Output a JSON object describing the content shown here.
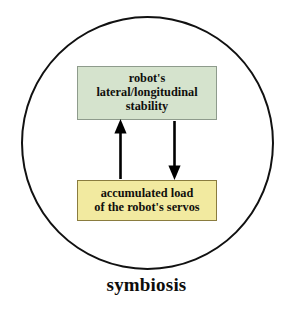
{
  "figure": {
    "caption": "symbiosis",
    "container_shape": "circle",
    "colors": {
      "circle_stroke": "#111111",
      "background": "#ffffff",
      "stability_fill": "#d5e3cd",
      "stability_border": "#8e9b8c",
      "load_fill": "#f2eaa0",
      "load_border": "#8a7c3f",
      "arrow": "#000000",
      "text": "#100f0c"
    },
    "nodes": [
      {
        "id": "stability",
        "lines": [
          "robot's",
          "lateral/longitudinal",
          "stability"
        ]
      },
      {
        "id": "load",
        "lines": [
          "accumulated load",
          "of the robot's servos"
        ]
      }
    ],
    "arrows": [
      {
        "id": "load-to-stability",
        "direction": "up",
        "from": "load",
        "to": "stability"
      },
      {
        "id": "stability-to-load",
        "direction": "down",
        "from": "stability",
        "to": "load"
      }
    ]
  }
}
